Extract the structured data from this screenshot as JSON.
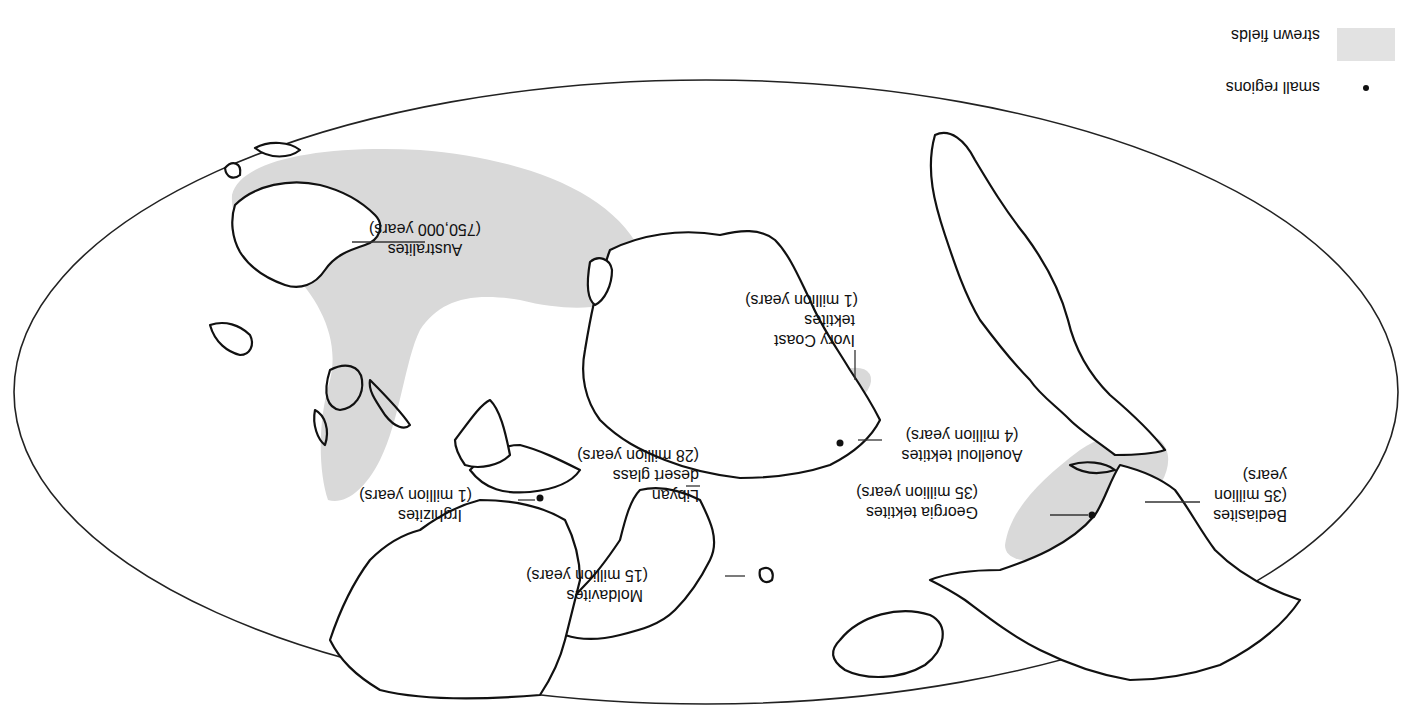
{
  "map": {
    "orientation": "rotated 180 degrees",
    "projection": "elliptical world map",
    "colors": {
      "strewn_field": "#d9d9d9",
      "coastline": "#111111",
      "background": "#ffffff"
    }
  },
  "legend": {
    "items": [
      {
        "symbol": "gray-swatch",
        "label": "strewn fields"
      },
      {
        "symbol": "dot",
        "label": "small regions"
      }
    ]
  },
  "labels": {
    "australites": {
      "name": "Australites",
      "age": "(750,000 years)"
    },
    "ivory_coast": {
      "name_line1": "Ivory Coast",
      "name_line2": "tektites",
      "age": "(1 million years)"
    },
    "libyan": {
      "name_line1": "Libyan",
      "name_line2": "desert glass",
      "age": "(28 million years)"
    },
    "aouelloul": {
      "name": "Aouelloul tektites",
      "age": "(4 million years)"
    },
    "irghizites": {
      "name": "Irghizites",
      "age": "(1 million years)"
    },
    "moldavites": {
      "name": "Moldavites",
      "age": "(15 million years)"
    },
    "georgia": {
      "name": "Georgia tektites",
      "age": "(35 million years)"
    },
    "bediasites": {
      "name": "Bediasites",
      "age_line1": "(35 million",
      "age_line2": "years)"
    }
  }
}
